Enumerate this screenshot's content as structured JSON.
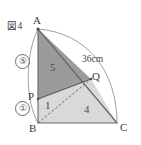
{
  "figure": {
    "caption": "図4",
    "points": {
      "A": {
        "label": "A",
        "x": 38,
        "y": 29
      },
      "B": {
        "label": "B",
        "x": 38,
        "y": 123
      },
      "C": {
        "label": "C",
        "x": 117,
        "y": 123
      },
      "P": {
        "label": "P",
        "x": 38,
        "y": 99
      },
      "Q": {
        "label": "Q",
        "x": 91,
        "y": 79
      }
    },
    "segment_ratios": {
      "AP": "⑤",
      "PB": "①"
    },
    "length_labels": {
      "arc_AC": "36cm"
    },
    "region_labels": {
      "triangle_APQ": "5",
      "triangle_PBQ": "1",
      "triangle_BQC": "4"
    },
    "colors": {
      "dark_region": "#9a9a9a",
      "light_region": "#d8d8d8",
      "stroke": "#5a5a5a",
      "arc_stroke": "#9a9a9a",
      "dashed_stroke": "#6a6a6a",
      "text": "#3a3a3a",
      "background": "#ffffff"
    }
  }
}
